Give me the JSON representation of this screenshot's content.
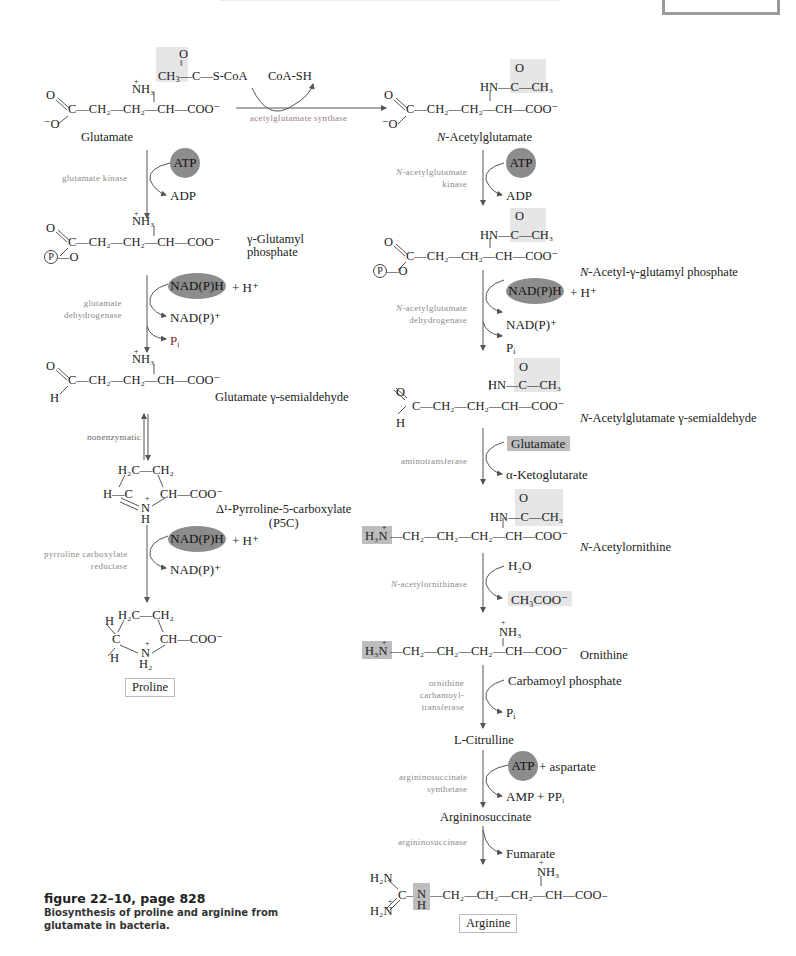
{
  "figure": {
    "caption_title": "figure 22–10, page 828",
    "caption_text": "Biosynthesis of proline and arginine from glutamate in bacteria."
  },
  "top_reaction": {
    "acetyl_coa": {
      "o": "O",
      "ch3": "CH",
      "ch3_sub": "3",
      "rest": "—C—",
      "scoa": "S-CoA"
    },
    "coash": "CoA-SH",
    "enzyme": "acetylglutamate synthase"
  },
  "left_pathway": {
    "glutamate": {
      "name": "Glutamate",
      "top_o": "O",
      "chain": "C—CH₂—CH₂—CH—COO⁻",
      "bottom_o": "⁻O",
      "nh3": "NH₃",
      "plus": "+"
    },
    "step1": {
      "enzyme": "glutamate kinase",
      "cofactor_in": "ATP",
      "cofactor_out": "ADP"
    },
    "glutamyl_phosphate": {
      "name_line1": "γ-Glutamyl",
      "name_line2": "phosphate",
      "top_o": "O",
      "chain": "C—CH₂—CH₂—CH—COO⁻",
      "p_group": "P",
      "link": "—O",
      "nh3": "NH₃",
      "plus": "+"
    },
    "step2": {
      "enzyme_line1": "glutamate",
      "enzyme_line2": "dehydrogenase",
      "cofactor_in": "NAD(P)H",
      "plus_h": "+ H⁺",
      "out1": "NAD(P)⁺",
      "out2": "P",
      "out2_sub": "i"
    },
    "semialdehyde": {
      "name": "Glutamate γ-semialdehyde",
      "top_o": "O",
      "chain": "C—CH₂—CH₂—CH—COO⁻",
      "h": "H",
      "nh3": "NH₃",
      "plus": "+"
    },
    "step3": {
      "enzyme": "nonenzymatic"
    },
    "p5c": {
      "name": "Δ¹-Pyrroline-5-carboxylate",
      "abbr": "(P5C)",
      "ring_top": "H₂C—CH₂",
      "left": "H—C",
      "right": "CH—COO⁻",
      "n": "N",
      "nh": "H",
      "plus": "+"
    },
    "step4": {
      "enzyme_line1": "pyrroline carboxylate",
      "enzyme_line2": "reductase",
      "cofactor_in": "NAD(P)H",
      "plus_h": "+ H⁺",
      "out1": "NAD(P)⁺"
    },
    "proline": {
      "name": "Proline",
      "ring_top": "H₂C—CH₂",
      "h_top": "H",
      "c": "C",
      "h_bottom": "H",
      "right": "CH—COO⁻",
      "n": "N",
      "nh2": "H₂",
      "plus": "+"
    }
  },
  "right_pathway": {
    "n_acetylglutamate": {
      "name_italic": "N",
      "name_rest": "-Acetylglutamate",
      "acetyl": "HN—C—CH₃",
      "acetyl_o": "O",
      "top_o": "O",
      "chain": "C—CH₂—CH₂—CH—COO⁻",
      "bottom_o": "⁻O"
    },
    "step1": {
      "enzyme_line1": "N-acetylglutamate",
      "enzyme_line2": "kinase",
      "cofactor_in": "ATP",
      "cofactor_out": "ADP"
    },
    "acetyl_glutamyl_phosphate": {
      "name_italic": "N",
      "name_rest": "-Acetyl-γ-glutamyl phosphate",
      "acetyl": "HN—C—CH₃",
      "acetyl_o": "O",
      "top_o": "O",
      "chain": "C—CH₂—CH₂—CH—COO⁻",
      "p_group": "P",
      "link": "—O"
    },
    "step2": {
      "enzyme_line1": "N-acetylglutamate",
      "enzyme_line2": "dehydrogenase",
      "cofactor_in": "NAD(P)H",
      "plus_h": "+ H⁺",
      "out1": "NAD(P)⁺",
      "out2": "P",
      "out2_sub": "i"
    },
    "acetyl_semialdehyde": {
      "name_italic": "N",
      "name_rest": "-Acetylglutamate γ-semialdehyde",
      "acetyl": "HN—C—CH₃",
      "acetyl_o": "O",
      "top_o": "O",
      "chain": "C—CH₂—CH₂—CH—COO⁻",
      "h": "H"
    },
    "step3": {
      "enzyme": "aminotransferase",
      "cofactor_in": "Glutamate",
      "cofactor_out": "α-Ketoglutarate"
    },
    "acetylornithine": {
      "name_italic": "N",
      "name_rest": "-Acetylornithine",
      "acetyl": "HN—C—CH₃",
      "acetyl_o": "O",
      "h3n": "H₃N",
      "plus": "+",
      "chain": "—CH₂—CH₂—CH₂—CH—COO⁻"
    },
    "step4": {
      "enzyme": "N-acetylornithinase",
      "cofactor_in": "H₂O",
      "cofactor_out": "CH₃COO⁻"
    },
    "ornithine": {
      "name": "Ornithine",
      "nh3": "NH₃",
      "plus": "+",
      "h3n": "H₃N",
      "chain": "—CH₂—CH₂—CH₂—CH—COO⁻"
    },
    "step5": {
      "enzyme_line1": "ornithine",
      "enzyme_line2": "carbamoyl-",
      "enzyme_line3": "transferase",
      "cofactor_in": "Carbamoyl phosphate",
      "out": "P",
      "out_sub": "i"
    },
    "citrulline": {
      "name": "L-Citrulline"
    },
    "step6": {
      "enzyme_line1": "argininosuccinate",
      "enzyme_line2": "synthetase",
      "cofactor_in": "ATP",
      "plus_asp": "+ aspartate",
      "out": "AMP + PP",
      "out_sub": "i"
    },
    "argininosuccinate": {
      "name": "Argininosuccinate"
    },
    "step7": {
      "enzyme": "argininosuccinase",
      "out": "Fumarate"
    },
    "arginine": {
      "name": "Arginine",
      "h2n_top": "H₂N",
      "h2n_bottom": "H₂N",
      "plus": "+",
      "c": "C—",
      "n": "N",
      "nh": "H",
      "chain": "—CH₂—CH₂—CH₂—CH—COO₋",
      "nh3": "NH₃"
    }
  },
  "colors": {
    "highlight_light": "#e6e6e6",
    "highlight_dark": "#bdbdbd",
    "ellipse": "#8c8c8c",
    "enzyme_text": "#8a8a8a",
    "arrow": "#555555"
  }
}
